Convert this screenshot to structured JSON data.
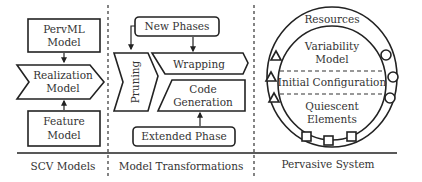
{
  "sections": {
    "scv_models": {
      "label": "SCV Models",
      "pervml": {
        "line1": "PervML",
        "line2": "Model"
      },
      "realization": {
        "line1": "Realization",
        "line2": "Model"
      },
      "feature": {
        "line1": "Feature",
        "line2": "Model"
      }
    },
    "model_transformations": {
      "label": "Model Transformations",
      "new_phases": "New Phases",
      "pruning": "Pruning",
      "wrapping": "Wrapping",
      "code_generation": {
        "line1": "Code",
        "line2": "Generation"
      },
      "extended_phase": "Extended Phase"
    },
    "pervasive_system": {
      "label": "Pervasive System",
      "resources": "Resources",
      "variability_model": {
        "line1": "Variability",
        "line2": "Model"
      },
      "initial_configuration": "Initial Configuration",
      "quiescent_elements": {
        "line1": "Quiescent",
        "line2": "Elements"
      },
      "resource_symbols": {
        "triangles": 3,
        "circles": 3,
        "squares": 3
      }
    }
  }
}
